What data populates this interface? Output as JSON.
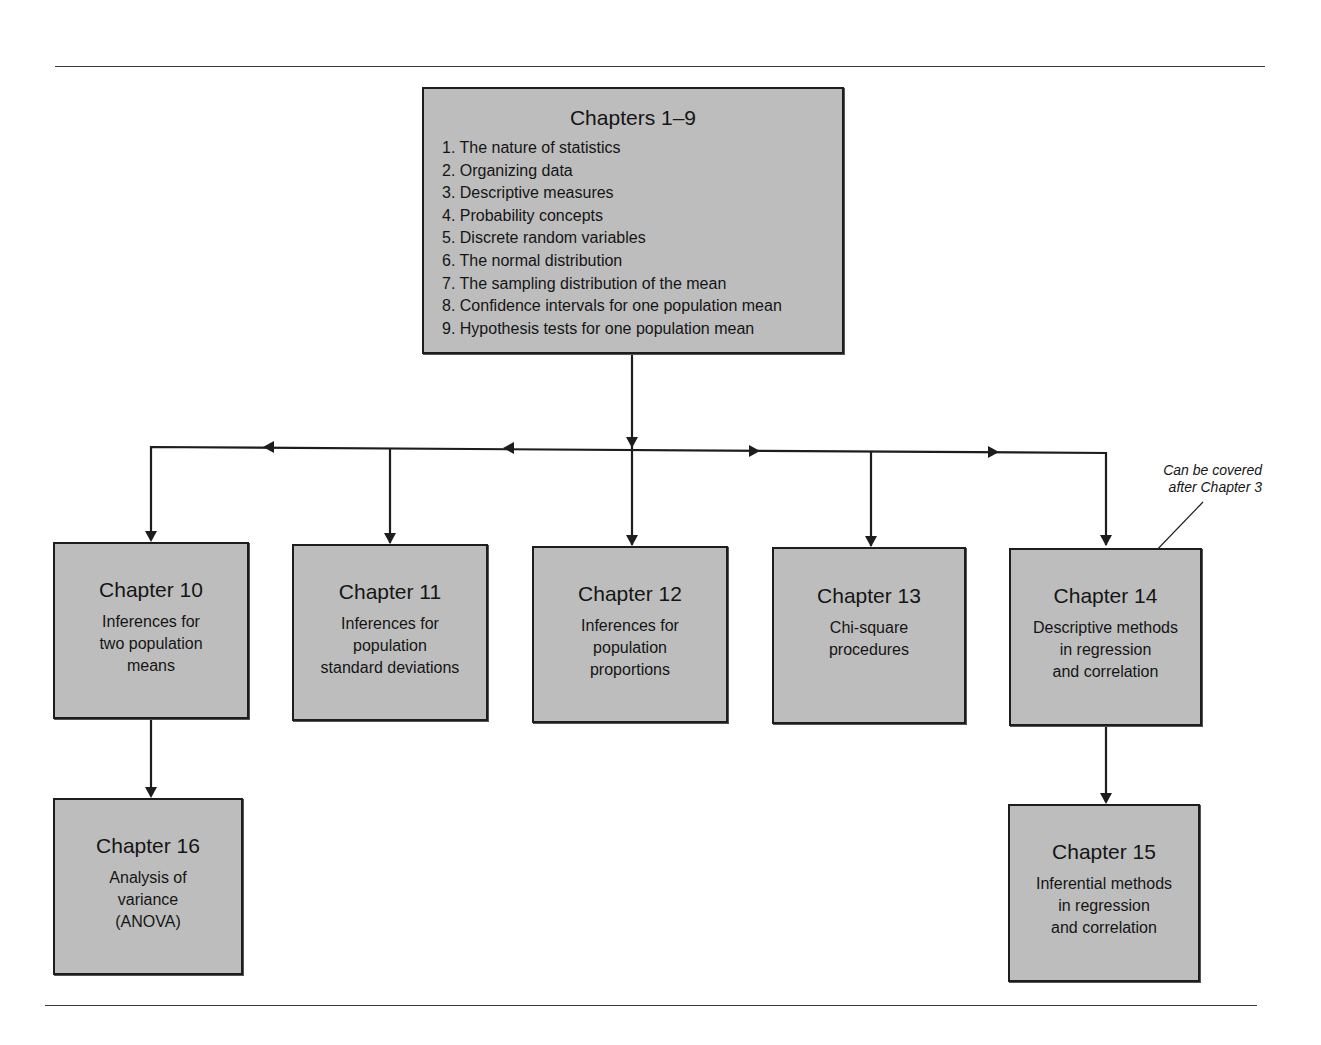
{
  "diagram": {
    "root": {
      "id": "chapters-1-9",
      "title": "Chapters 1–9",
      "items": [
        "1. The nature of statistics",
        "2. Organizing data",
        "3. Descriptive measures",
        "4. Probability concepts",
        "5. Discrete random variables",
        "6. The normal distribution",
        "7. The sampling distribution of the mean",
        "8. Confidence intervals for one population mean",
        "9. Hypothesis tests for one population mean"
      ]
    },
    "chapters": [
      {
        "id": "ch10",
        "title": "Chapter 10",
        "lines": [
          "Inferences for",
          "two population",
          "means"
        ]
      },
      {
        "id": "ch11",
        "title": "Chapter 11",
        "lines": [
          "Inferences for",
          "population",
          "standard deviations"
        ]
      },
      {
        "id": "ch12",
        "title": "Chapter 12",
        "lines": [
          "Inferences for",
          "population",
          "proportions"
        ]
      },
      {
        "id": "ch13",
        "title": "Chapter 13",
        "lines": [
          "Chi-square",
          "procedures"
        ]
      },
      {
        "id": "ch14",
        "title": "Chapter 14",
        "lines": [
          "Descriptive methods",
          "in regression",
          "and correlation"
        ]
      },
      {
        "id": "ch16",
        "title": "Chapter 16",
        "lines": [
          "Analysis of",
          "variance",
          "(ANOVA)"
        ]
      },
      {
        "id": "ch15",
        "title": "Chapter 15",
        "lines": [
          "Inferential methods",
          "in regression",
          "and correlation"
        ]
      }
    ],
    "edges": [
      {
        "from": "chapters-1-9",
        "to": "ch10"
      },
      {
        "from": "chapters-1-9",
        "to": "ch11"
      },
      {
        "from": "chapters-1-9",
        "to": "ch12"
      },
      {
        "from": "chapters-1-9",
        "to": "ch13"
      },
      {
        "from": "chapters-1-9",
        "to": "ch14"
      },
      {
        "from": "ch10",
        "to": "ch16"
      },
      {
        "from": "ch14",
        "to": "ch15"
      }
    ],
    "annotation": {
      "target": "ch14",
      "lines": [
        "Can be covered",
        "after Chapter 3"
      ]
    },
    "colors": {
      "box_fill": "#bdbdbd",
      "line": "#1d1d1d"
    }
  }
}
